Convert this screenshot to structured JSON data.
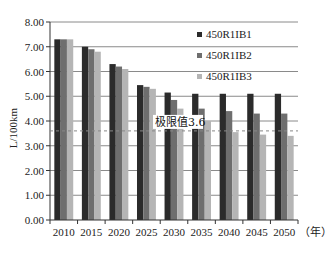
{
  "chart_data": {
    "type": "bar",
    "title": "",
    "xlabel": "（年）",
    "ylabel": "L/100km",
    "ylim": [
      0,
      8
    ],
    "yticks": [
      "0.00",
      "1.00",
      "2.00",
      "3.00",
      "4.00",
      "5.00",
      "6.00",
      "7.00",
      "8.00"
    ],
    "categories": [
      "2010",
      "2015",
      "2020",
      "2025",
      "2030",
      "2035",
      "2040",
      "2045",
      "2050"
    ],
    "series": [
      {
        "name": "450R1IB1",
        "color": "#2b2b2b",
        "values": [
          7.3,
          7.0,
          6.3,
          5.45,
          5.15,
          5.1,
          5.1,
          5.1,
          5.1
        ]
      },
      {
        "name": "450R1IB2",
        "color": "#6e6e6e",
        "values": [
          7.3,
          6.9,
          6.2,
          5.38,
          4.85,
          4.5,
          4.4,
          4.3,
          4.3
        ]
      },
      {
        "name": "450R1IB3",
        "color": "#b5b5b5",
        "values": [
          7.3,
          6.8,
          6.1,
          5.3,
          4.5,
          4.0,
          3.55,
          3.45,
          3.4
        ]
      }
    ],
    "reference_line": {
      "value": 3.6,
      "label": "极限值3.6",
      "style": "dashed"
    },
    "grid": true,
    "legend_position": "upper-right-inside"
  }
}
